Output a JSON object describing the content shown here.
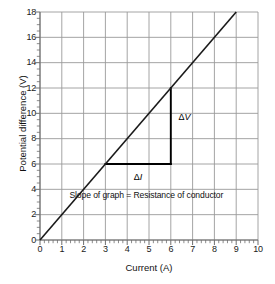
{
  "chart_data": {
    "type": "line",
    "title": "",
    "xlabel": "Current (A)",
    "ylabel": "Potential difference (V)",
    "xlim": [
      0,
      10
    ],
    "ylim": [
      0,
      18
    ],
    "grid": true,
    "legend_position": "none",
    "x_ticks": [
      "0",
      "1",
      "2",
      "3",
      "4",
      "5",
      "6",
      "7",
      "8",
      "9",
      "10"
    ],
    "y_ticks": [
      "0",
      "2",
      "4",
      "6",
      "8",
      "10",
      "12",
      "14",
      "16",
      "18"
    ],
    "x_tick_values": [
      0,
      1,
      2,
      3,
      4,
      5,
      6,
      7,
      8,
      9,
      10
    ],
    "y_tick_values": [
      0,
      2,
      4,
      6,
      8,
      10,
      12,
      14,
      16,
      18
    ],
    "x_minor_per_major": 5,
    "y_minor_per_major": 4,
    "series": [
      {
        "name": "Potential difference vs Current",
        "x": [
          0,
          9
        ],
        "values": [
          0,
          18
        ],
        "slope": 2,
        "color": "#1a1a1a"
      }
    ],
    "annotations": [
      {
        "name": "slope-note",
        "text": "Slope of graph = Resistance of conductor",
        "x": 1.35,
        "y": 3.55
      },
      {
        "name": "delta-v-label",
        "text_delta": "Δ",
        "text_symbol": "V",
        "x": 6.35,
        "y": 9.7
      },
      {
        "name": "delta-i-label",
        "text_delta": "Δ",
        "text_symbol": "I",
        "x": 4.3,
        "y": 4.95
      }
    ],
    "gradient_triangle": {
      "name": "gradient-triangle",
      "points": [
        [
          3,
          6
        ],
        [
          6,
          6
        ],
        [
          6,
          12
        ]
      ],
      "run_from": [
        3,
        6
      ],
      "run_to": [
        6,
        6
      ],
      "rise_from": [
        6,
        6
      ],
      "rise_to": [
        6,
        12
      ],
      "delta_i": 3,
      "delta_v": 12,
      "color": "#000000"
    },
    "colors": {
      "grid": "#9a9a9a",
      "axis": "#6e6e6e",
      "line": "#1a1a1a",
      "text": "#111111",
      "background": "#ffffff"
    }
  }
}
